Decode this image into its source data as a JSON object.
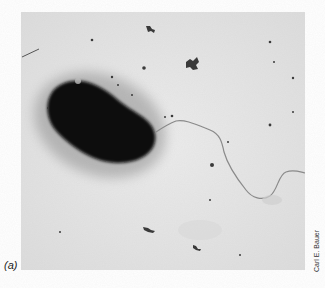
{
  "figure": {
    "panel_label": "(a)",
    "photo_credit": "Carl E. Bauer",
    "colors": {
      "background": "#e6e6e6",
      "cell": "#0c0c0c",
      "halo": "#9a9a9a",
      "flagellum": "#8a8a8a",
      "debris": "#3a3a3a"
    }
  }
}
